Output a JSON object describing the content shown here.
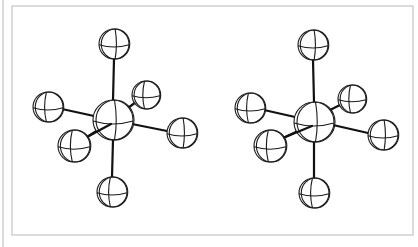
{
  "figure": {
    "colors": {
      "bond": "#111111",
      "atom_outline": "#1a1a1a",
      "frame": "#cfcfcf",
      "background": "#ffffff"
    },
    "frame": {
      "outer_left_x": 3,
      "inner": {
        "x": 12,
        "y": 6,
        "w": 401,
        "h": 229
      }
    },
    "views": [
      {
        "name": "left-view",
        "central_atom": {
          "x": 113,
          "y": 120,
          "r": 20
        },
        "ligands": [
          {
            "name": "top",
            "x": 114,
            "y": 44,
            "r": 15,
            "bond_from": [
              113,
              100
            ],
            "bond_to": [
              114,
              59
            ]
          },
          {
            "name": "bottom",
            "x": 112,
            "y": 192,
            "r": 15,
            "bond_from": [
              113,
              140
            ],
            "bond_to": [
              112,
              177
            ]
          },
          {
            "name": "left",
            "x": 48,
            "y": 107,
            "r": 15,
            "bond_from": [
              94,
              116
            ],
            "bond_to": [
              62,
              109
            ]
          },
          {
            "name": "right",
            "x": 182,
            "y": 133,
            "r": 15,
            "bond_from": [
              132,
              124
            ],
            "bond_to": [
              167,
              131
            ]
          },
          {
            "name": "front-left",
            "x": 74,
            "y": 146,
            "r": 16,
            "bond_from": [
              98,
              130
            ],
            "bond_to": [
              87,
              137
            ]
          },
          {
            "name": "back-right",
            "x": 146,
            "y": 95,
            "r": 14,
            "bond_from": [
              128,
              108
            ],
            "bond_to": [
              136,
              102
            ]
          }
        ]
      },
      {
        "name": "right-view",
        "central_atom": {
          "x": 314,
          "y": 122,
          "r": 20
        },
        "ligands": [
          {
            "name": "top",
            "x": 313,
            "y": 45,
            "r": 15,
            "bond_from": [
              314,
              102
            ],
            "bond_to": [
              313,
              60
            ]
          },
          {
            "name": "bottom",
            "x": 314,
            "y": 193,
            "r": 15,
            "bond_from": [
              314,
              142
            ],
            "bond_to": [
              314,
              178
            ]
          },
          {
            "name": "left",
            "x": 250,
            "y": 108,
            "r": 15,
            "bond_from": [
              295,
              117
            ],
            "bond_to": [
              264,
              110
            ]
          },
          {
            "name": "right",
            "x": 383,
            "y": 135,
            "r": 15,
            "bond_from": [
              333,
              125
            ],
            "bond_to": [
              368,
              133
            ]
          },
          {
            "name": "front-left",
            "x": 270,
            "y": 146,
            "r": 16,
            "bond_from": [
              298,
              131
            ],
            "bond_to": [
              283,
              138
            ]
          },
          {
            "name": "back-right",
            "x": 352,
            "y": 99,
            "r": 14,
            "bond_from": [
              330,
              110
            ],
            "bond_to": [
              342,
              104
            ]
          }
        ]
      }
    ]
  }
}
